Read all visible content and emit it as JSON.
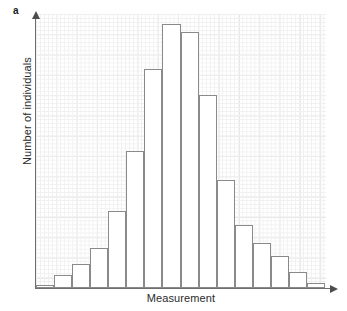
{
  "figure": {
    "panel_label": "a",
    "background_color": "#ffffff",
    "grid_color": "#eeeeef",
    "axis_color": "#6e6e6e",
    "bar_edge_color": "#8a8a8a",
    "bar_fill_color": "#ffffff"
  },
  "chart_data": {
    "type": "bar",
    "title": "",
    "subtitle": "",
    "xlabel": "Measurement",
    "ylabel": "Number of individuals",
    "categories": [
      "1",
      "2",
      "3",
      "4",
      "5",
      "6",
      "7",
      "8",
      "9",
      "10",
      "11",
      "12",
      "13",
      "14",
      "15",
      "16"
    ],
    "values": [
      1,
      5,
      9,
      15,
      29,
      52,
      83,
      100,
      97,
      73,
      41,
      24,
      17,
      12,
      6,
      2
    ],
    "series": [
      {
        "name": "Frequency distribution",
        "values": [
          1,
          5,
          9,
          15,
          29,
          52,
          83,
          100,
          97,
          73,
          41,
          24,
          17,
          12,
          6,
          2
        ]
      }
    ],
    "ylim": [
      0,
      100
    ],
    "xlim": [
      0,
      16
    ],
    "grid": true,
    "grid_style": "graph-paper",
    "legend": false,
    "legend_position": "none",
    "tick_labels_x": [],
    "tick_labels_y": [],
    "annotations": []
  },
  "axes": {
    "x_title": "Measurement",
    "y_title": "Number of individuals",
    "x_arrow": "arrow-right",
    "y_arrow": "arrow-up"
  }
}
